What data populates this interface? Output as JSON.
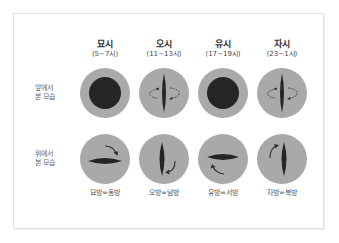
{
  "columns": [
    {
      "name": "묘시",
      "time": "(5~7시)",
      "direction": "묘방=동방"
    },
    {
      "name": "오시",
      "time": "(11~13시)",
      "direction": "오방=남방"
    },
    {
      "name": "유시",
      "time": "(17~19시)",
      "direction": "유방=서방"
    },
    {
      "name": "자시",
      "time": "(23~1시)",
      "direction": "자방=북방"
    }
  ],
  "rows": [
    {
      "label_line1": "앞에서",
      "label_line2": "본 모습"
    },
    {
      "label_line1": "위에서",
      "label_line2": "본 모습"
    }
  ],
  "colors": {
    "iris": "#a9a9a9",
    "iris_edge": "#9a9a9a",
    "pupil": "#252525",
    "border": "#e2e2e2"
  }
}
